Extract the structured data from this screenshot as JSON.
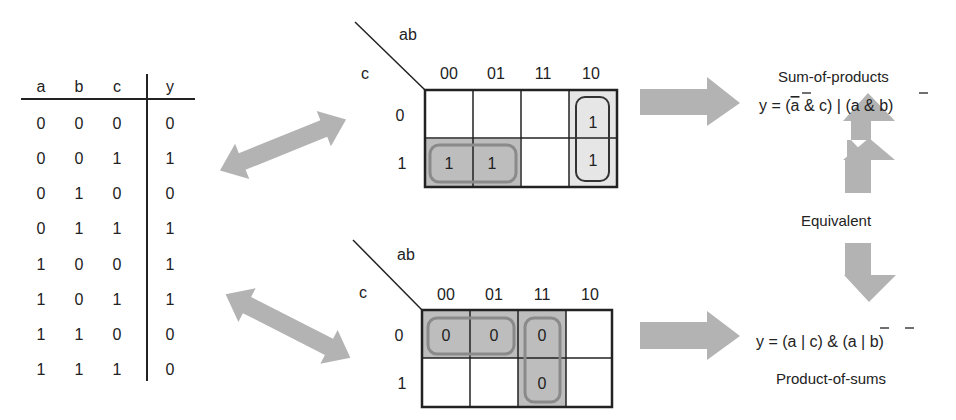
{
  "truth_table": {
    "headers": [
      "a",
      "b",
      "c",
      "y"
    ],
    "rows": [
      [
        "0",
        "0",
        "0",
        "0"
      ],
      [
        "0",
        "0",
        "1",
        "1"
      ],
      [
        "0",
        "1",
        "0",
        "0"
      ],
      [
        "0",
        "1",
        "1",
        "1"
      ],
      [
        "1",
        "0",
        "0",
        "1"
      ],
      [
        "1",
        "0",
        "1",
        "1"
      ],
      [
        "1",
        "1",
        "0",
        "0"
      ],
      [
        "1",
        "1",
        "1",
        "0"
      ]
    ]
  },
  "kmap_sop": {
    "col_var": "ab",
    "row_var": "c",
    "col_labels": [
      "00",
      "01",
      "11",
      "10"
    ],
    "row_labels": [
      "0",
      "1"
    ],
    "cells": [
      [
        "",
        "",
        "",
        "1"
      ],
      [
        "1",
        "1",
        "",
        "1"
      ]
    ],
    "groups": [
      "c=1, ab=00/01 (a̅ & c)",
      "ab=10, c=0/1 (a & b̅)"
    ]
  },
  "kmap_pos": {
    "col_var": "ab",
    "row_var": "c",
    "col_labels": [
      "00",
      "01",
      "11",
      "10"
    ],
    "row_labels": [
      "0",
      "1"
    ],
    "cells": [
      [
        "0",
        "0",
        "0",
        ""
      ],
      [
        "",
        "",
        "0",
        ""
      ]
    ],
    "groups": [
      "c=0, ab=00/01 (a | c)",
      "ab=11, c=0/1 (a̅ | b̅)"
    ]
  },
  "sop": {
    "title": "Sum-of-products",
    "equation_parts": [
      "y = (",
      "a",
      " & c) | (a & ",
      "b",
      ")"
    ]
  },
  "pos": {
    "title": "Product-of-sums",
    "equation_parts": [
      "y = (a | c) & (",
      "a",
      " | ",
      "b",
      ")"
    ]
  },
  "equivalent_label": "Equivalent",
  "colors": {
    "arrow": "#b3b3b3",
    "group_fill": "#bdbdbd",
    "group_stroke": "#8a8a8a",
    "light_fill": "#e6e6e6",
    "line": "#222222"
  }
}
